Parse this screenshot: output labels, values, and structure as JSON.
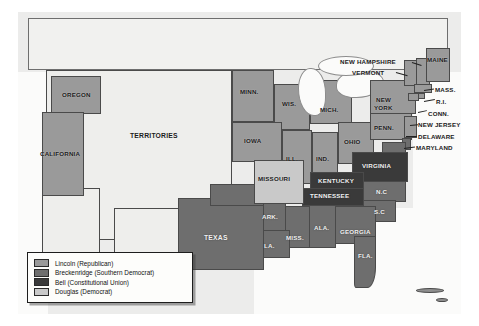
{
  "map": {
    "title": "United States Presidential Election of 1860",
    "legend": {
      "entries": [
        {
          "label": "Lincoln (Republican)",
          "color": "#9a9a9a",
          "swatch": "lincoln"
        },
        {
          "label": "Breckenridge (Southern Democrat)",
          "color": "#6e6e6e",
          "swatch": "breck"
        },
        {
          "label": "Bell (Constitutional Union)",
          "color": "#3a3a3a",
          "swatch": "bell"
        },
        {
          "label": "Douglas (Democrat)",
          "color": "#c9c9c9",
          "swatch": "douglas"
        }
      ]
    },
    "regions": {
      "territories": "TERRITORIES",
      "oregon": "OREGON",
      "california": "CALIFORNIA",
      "minnesota": "MINN.",
      "wisconsin": "WIS.",
      "iowa": "IOWA",
      "illinois": "ILL.",
      "indiana": "IND.",
      "michigan": "MICH.",
      "ohio": "OHIO",
      "pennsylvania": "PENN.",
      "new_york": "NEW\nYORK",
      "new_york_line1": "NEW",
      "new_york_line2": "YORK",
      "new_hampshire": "NEW HAMPSHIRE",
      "vermont": "VERMONT",
      "maine": "MAINE",
      "massachusetts": "MASS.",
      "rhode_island": "R.I.",
      "connecticut": "CONN.",
      "new_jersey": "NEW JERSEY",
      "delaware": "DELAWARE",
      "maryland": "MARYLAND",
      "virginia": "VIRGINIA",
      "kentucky": "KENTUCKY",
      "tennessee": "TENNESSEE",
      "missouri": "MISSOURI",
      "arkansas": "ARK.",
      "louisiana": "LA.",
      "mississippi": "MISS.",
      "alabama": "ALA.",
      "georgia": "GEORGIA",
      "florida": "FLA.",
      "north_carolina": "N.C",
      "south_carolina": "S.C",
      "texas": "TEXAS"
    }
  }
}
